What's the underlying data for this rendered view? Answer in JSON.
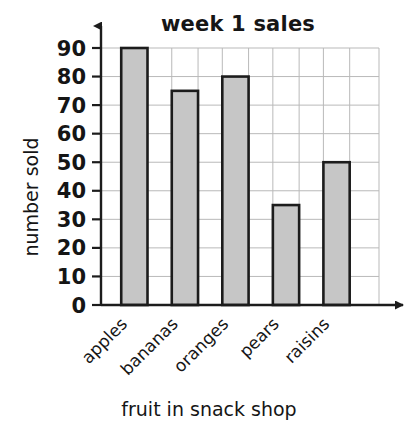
{
  "chart_data": {
    "type": "bar",
    "title": "week 1 sales",
    "xlabel": "fruit in snack shop",
    "ylabel": "number sold",
    "categories": [
      "apples",
      "bananas",
      "oranges",
      "pears",
      "raisins"
    ],
    "values": [
      90,
      75,
      80,
      35,
      50
    ],
    "ylim": [
      0,
      90
    ],
    "ytick_labels": [
      "0",
      "10",
      "20",
      "30",
      "40",
      "50",
      "60",
      "70",
      "80",
      "90"
    ],
    "ytick_values": [
      0,
      10,
      20,
      30,
      40,
      50,
      60,
      70,
      80,
      90
    ],
    "grid": true,
    "legend": "none",
    "bar_fill_color": "#c6c6c6",
    "bar_edge_color": "#1c1c1c",
    "grid_color": "#b9b9b9",
    "axis_color": "#1c1c1c",
    "background_color": "#ffffff",
    "axis_arrows": true,
    "category_label_rotation": -45
  }
}
